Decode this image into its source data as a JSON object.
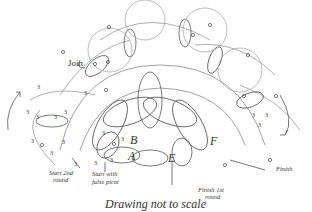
{
  "diagram": {
    "caption": "Drawing not to scale",
    "labels": {
      "join": "Join",
      "start_2nd_round_line1": "Start 2nd",
      "start_2nd_round_line2": "round",
      "start_false_picot_line1": "Start with",
      "start_false_picot_line2": "false picot",
      "finish_1st_round_line1": "Finish 1st",
      "finish_1st_round_line2": "round",
      "finish": "Finish"
    },
    "ring_letters": [
      "A",
      "B",
      "E",
      "F"
    ],
    "stitch_counts": [
      "3",
      "3",
      "3",
      "3",
      "3",
      "3",
      "3",
      "3",
      "3",
      "3",
      "3",
      "3",
      "3",
      "3",
      "3",
      "3",
      "3"
    ],
    "colors": {
      "line": "#555555",
      "text": "#333333",
      "background": "#ffffff"
    }
  }
}
